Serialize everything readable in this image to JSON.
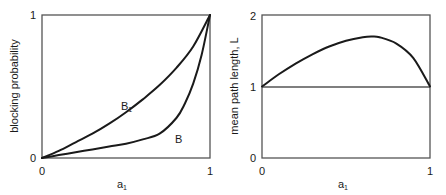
{
  "chart_data": [
    {
      "type": "line",
      "title": "",
      "xlabel": "a",
      "xlabel_sub": "1",
      "ylabel": "blocking probability",
      "xlim": [
        0,
        1
      ],
      "ylim": [
        0,
        1
      ],
      "xticks": [
        "0",
        "1"
      ],
      "yticks": [
        "0",
        "1"
      ],
      "grid": false,
      "series": [
        {
          "name": "B1",
          "label_main": "B",
          "label_sub": "1",
          "x": [
            0,
            0.1,
            0.2,
            0.3,
            0.4,
            0.5,
            0.6,
            0.7,
            0.8,
            0.9,
            1.0
          ],
          "y": [
            0,
            0.05,
            0.11,
            0.17,
            0.24,
            0.32,
            0.41,
            0.51,
            0.63,
            0.78,
            1.0
          ]
        },
        {
          "name": "B",
          "label_main": "B",
          "label_sub": "",
          "x": [
            0,
            0.1,
            0.2,
            0.3,
            0.4,
            0.5,
            0.6,
            0.7,
            0.8,
            0.85,
            0.9,
            0.95,
            1.0
          ],
          "y": [
            0,
            0.02,
            0.04,
            0.06,
            0.08,
            0.1,
            0.13,
            0.17,
            0.28,
            0.38,
            0.52,
            0.72,
            1.0
          ]
        }
      ]
    },
    {
      "type": "line",
      "title": "",
      "xlabel": "a",
      "xlabel_sub": "1",
      "ylabel": "mean path length, L",
      "xlim": [
        0,
        1
      ],
      "ylim": [
        0,
        2
      ],
      "xticks": [
        "0",
        "1"
      ],
      "yticks": [
        "0",
        "1",
        "2"
      ],
      "grid": false,
      "reference_line": {
        "y": 1
      },
      "series": [
        {
          "name": "L",
          "x": [
            0,
            0.1,
            0.2,
            0.3,
            0.4,
            0.5,
            0.6,
            0.65,
            0.7,
            0.8,
            0.9,
            1.0
          ],
          "y": [
            1.0,
            1.17,
            1.32,
            1.45,
            1.56,
            1.64,
            1.69,
            1.7,
            1.69,
            1.6,
            1.4,
            1.0
          ]
        }
      ]
    }
  ]
}
